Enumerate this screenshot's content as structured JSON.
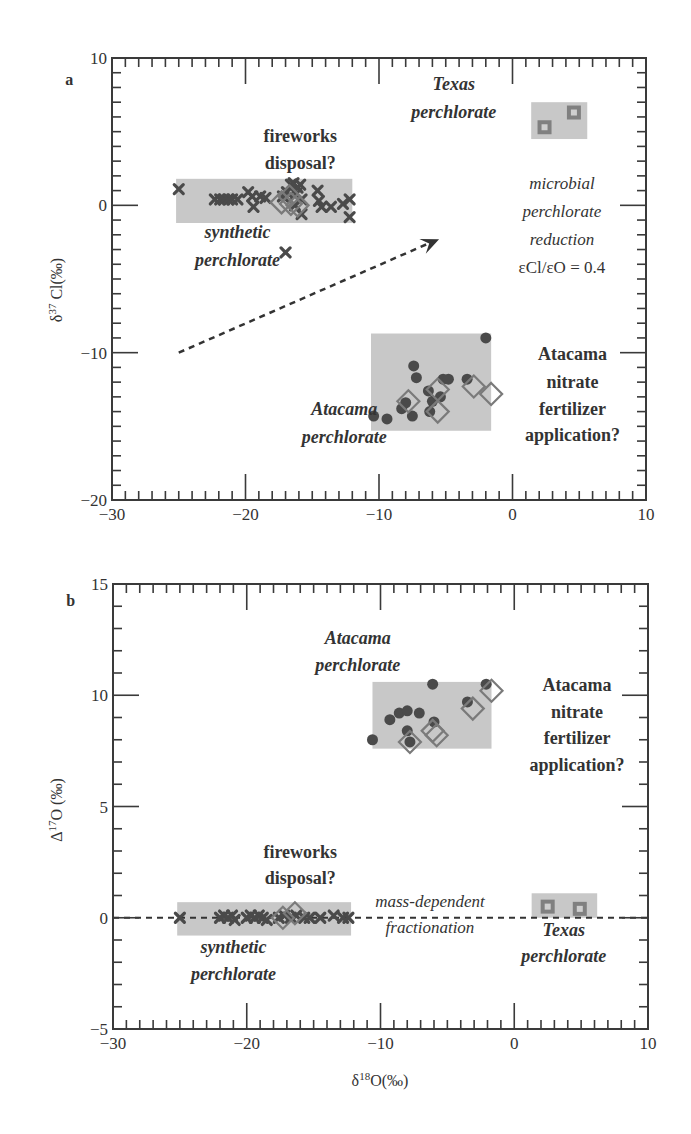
{
  "figure": {
    "colors": {
      "frame": "#3a3a3a",
      "region": "#c8c8c8",
      "marker_dark": "#4a4a4a",
      "marker_diamond": "#7a7a7a",
      "texas_square": "#808080",
      "texas_inner": "#cfcfcf",
      "text": "#333333"
    }
  },
  "chart_data": [
    {
      "panel": "a",
      "type": "scatter",
      "title": "",
      "xlabel": "δ18O(‰)",
      "ylabel": "δ37 Cl(‰)",
      "ylabel_base": "δ",
      "ylabel_sup": "37",
      "ylabel_rest": " Cl(‰)",
      "xlim": [
        -30,
        10
      ],
      "ylim": [
        -20,
        10
      ],
      "xticks": [
        -30,
        -20,
        -10,
        0,
        10
      ],
      "yticks": [
        10,
        0,
        -10,
        -20
      ],
      "grid": false,
      "regions": [
        {
          "name": "synthetic perchlorate",
          "x": [
            -25.2,
            -12
          ],
          "y": [
            -1.2,
            1.8
          ]
        },
        {
          "name": "Texas perchlorate",
          "x": [
            1.4,
            5.6
          ],
          "y": [
            4.5,
            7.0
          ]
        },
        {
          "name": "Atacama perchlorate",
          "x": [
            -10.6,
            -1.6
          ],
          "y": [
            -15.3,
            -8.7
          ]
        }
      ],
      "series": [
        {
          "name": "synthetic perchlorate",
          "marker": "x",
          "points": [
            [
              -25.0,
              1.1
            ],
            [
              -22.3,
              0.4
            ],
            [
              -21.9,
              0.4
            ],
            [
              -21.6,
              0.4
            ],
            [
              -21.3,
              0.4
            ],
            [
              -21.0,
              0.4
            ],
            [
              -20.6,
              0.4
            ],
            [
              -19.8,
              0.9
            ],
            [
              -19.5,
              0.6
            ],
            [
              -19.4,
              -0.1
            ],
            [
              -18.9,
              0.6
            ],
            [
              -18.5,
              0.5
            ],
            [
              -17.2,
              0.6
            ],
            [
              -16.9,
              0.9
            ],
            [
              -16.6,
              1.4
            ],
            [
              -16.4,
              1.5
            ],
            [
              -16.1,
              1.2
            ],
            [
              -15.9,
              1.4
            ],
            [
              -16.2,
              0.8
            ],
            [
              -15.8,
              0.4
            ],
            [
              -16.3,
              0.0
            ],
            [
              -15.8,
              -0.6
            ],
            [
              -14.6,
              1.0
            ],
            [
              -14.5,
              0.3
            ],
            [
              -14.3,
              -0.1
            ],
            [
              -13.6,
              -0.1
            ],
            [
              -12.7,
              0.1
            ],
            [
              -12.2,
              0.4
            ],
            [
              -12.2,
              -0.8
            ],
            [
              -17.0,
              -3.2
            ]
          ]
        },
        {
          "name": "fireworks disposal?",
          "marker": "diamond",
          "points": [
            [
              -17.3,
              0.2
            ],
            [
              -16.6,
              0.1
            ],
            [
              -16.1,
              0.0
            ],
            [
              -16.7,
              0.6
            ]
          ]
        },
        {
          "name": "Texas perchlorate",
          "marker": "square",
          "points": [
            [
              2.4,
              5.3
            ],
            [
              4.6,
              6.3
            ]
          ]
        },
        {
          "name": "Atacama perchlorate",
          "marker": "circle",
          "points": [
            [
              -10.4,
              -14.3
            ],
            [
              -9.4,
              -14.5
            ],
            [
              -8.3,
              -13.8
            ],
            [
              -8.0,
              -13.4
            ],
            [
              -7.2,
              -11.7
            ],
            [
              -6.3,
              -12.6
            ],
            [
              -6.2,
              -14.0
            ],
            [
              -6.0,
              -13.3
            ],
            [
              -5.4,
              -13.0
            ],
            [
              -5.2,
              -11.8
            ],
            [
              -4.8,
              -11.8
            ],
            [
              -2.0,
              -9.0
            ],
            [
              -3.4,
              -11.8
            ],
            [
              -7.5,
              -14.3
            ],
            [
              -7.4,
              -10.9
            ]
          ]
        },
        {
          "name": "Atacama nitrate fertilizer application?",
          "marker": "diamond",
          "points": [
            [
              -7.8,
              -13.3
            ],
            [
              -5.6,
              -12.5
            ],
            [
              -5.6,
              -14.0
            ],
            [
              -2.9,
              -12.3
            ],
            [
              -1.6,
              -12.8
            ]
          ]
        }
      ],
      "annotations": [
        {
          "id": "panel_letter",
          "text": "a",
          "style": "panel-letter",
          "x": -33.5,
          "y": 8.2
        },
        {
          "id": "fireworks1",
          "text": "fireworks",
          "style": "ann-bold",
          "x": -15.9,
          "y": 4.3
        },
        {
          "id": "fireworks2",
          "text": "disposal?",
          "style": "ann-bold",
          "x": -15.9,
          "y": 2.5
        },
        {
          "id": "synthetic1",
          "text": "synthetic",
          "style": "ann-bolditalic",
          "x": -20.6,
          "y": -2.2
        },
        {
          "id": "synthetic2",
          "text": "perchlorate",
          "style": "ann-bolditalic",
          "x": -20.6,
          "y": -4.1
        },
        {
          "id": "texas1",
          "text": "Texas",
          "style": "ann-bolditalic",
          "x": -4.4,
          "y": 7.8
        },
        {
          "id": "texas2",
          "text": "perchlorate",
          "style": "ann-bolditalic",
          "x": -4.4,
          "y": 5.9
        },
        {
          "id": "microbial1",
          "text": "microbial",
          "style": "ann-italic",
          "x": 3.7,
          "y": 1.1
        },
        {
          "id": "microbial2",
          "text": "perchlorate",
          "style": "ann-italic",
          "x": 3.7,
          "y": -0.8
        },
        {
          "id": "microbial3",
          "text": "reduction",
          "style": "ann-italic",
          "x": 3.7,
          "y": -2.7
        },
        {
          "id": "microbial4",
          "text": "εCl/εO = 0.4",
          "style": "ann-plain",
          "x": 3.7,
          "y": -4.6
        },
        {
          "id": "atacama1",
          "text": "Atacama",
          "style": "ann-bolditalic",
          "x": -12.6,
          "y": -14.2
        },
        {
          "id": "atacama2",
          "text": "perchlorate",
          "style": "ann-bolditalic",
          "x": -12.6,
          "y": -16.1
        },
        {
          "id": "nitrate1",
          "text": "Atacama",
          "style": "ann-bold",
          "x": 4.5,
          "y": -10.5
        },
        {
          "id": "nitrate2",
          "text": "nitrate",
          "style": "ann-bold",
          "x": 4.5,
          "y": -12.4
        },
        {
          "id": "nitrate3",
          "text": "fertilizer",
          "style": "ann-bold",
          "x": 4.5,
          "y": -14.2
        },
        {
          "id": "nitrate4",
          "text": "application?",
          "style": "ann-bold",
          "x": 4.5,
          "y": -16.0
        }
      ],
      "arrow": {
        "label": "microbial perchlorate reduction",
        "from": [
          -25.0,
          -10.0
        ],
        "to": [
          -5.5,
          -2.3
        ],
        "style": "dashed"
      }
    },
    {
      "panel": "b",
      "type": "scatter",
      "title": "",
      "xlabel": "δ18O(‰)",
      "xlabel_base": "δ",
      "xlabel_sup": "18",
      "xlabel_rest": "O(‰)",
      "ylabel": "Δ17O (‰)",
      "ylabel_base": "Δ",
      "ylabel_sup": "17",
      "ylabel_rest": "O (‰)",
      "xlim": [
        -30,
        10
      ],
      "ylim": [
        -5,
        15
      ],
      "xticks": [
        -30,
        -20,
        -10,
        0,
        10
      ],
      "yticks": [
        15,
        10,
        5,
        0,
        -5
      ],
      "grid": false,
      "regions": [
        {
          "name": "synthetic perchlorate",
          "x": [
            -25.2,
            -12.2
          ],
          "y": [
            -0.8,
            0.7
          ]
        },
        {
          "name": "Atacama perchlorate",
          "x": [
            -10.6,
            -1.7
          ],
          "y": [
            7.6,
            10.6
          ]
        },
        {
          "name": "Texas perchlorate",
          "x": [
            1.3,
            6.2
          ],
          "y": [
            0.0,
            1.1
          ]
        }
      ],
      "reference_line": {
        "name": "mass-dependent fractionation",
        "y": 0,
        "style": "dashed"
      },
      "series": [
        {
          "name": "synthetic perchlorate",
          "marker": "x",
          "points": [
            [
              -25.0,
              0.0
            ],
            [
              -22.0,
              0.0
            ],
            [
              -21.7,
              0.1
            ],
            [
              -21.4,
              0.0
            ],
            [
              -21.1,
              0.1
            ],
            [
              -20.9,
              -0.1
            ],
            [
              -20.0,
              0.0
            ],
            [
              -19.7,
              0.1
            ],
            [
              -19.4,
              0.0
            ],
            [
              -19.1,
              0.1
            ],
            [
              -18.8,
              0.0
            ],
            [
              -18.5,
              -0.1
            ],
            [
              -17.6,
              0.0
            ],
            [
              -17.2,
              0.1
            ],
            [
              -16.7,
              0.0
            ],
            [
              -16.3,
              0.1
            ],
            [
              -15.7,
              0.0
            ],
            [
              -15.3,
              0.0
            ],
            [
              -14.5,
              0.0
            ],
            [
              -13.5,
              0.1
            ],
            [
              -12.8,
              0.0
            ],
            [
              -12.4,
              0.0
            ]
          ]
        },
        {
          "name": "fireworks disposal?",
          "marker": "diamond",
          "points": [
            [
              -17.3,
              0.0
            ],
            [
              -16.4,
              0.2
            ]
          ]
        },
        {
          "name": "Atacama perchlorate",
          "marker": "circle",
          "points": [
            [
              -10.6,
              8.0
            ],
            [
              -9.3,
              8.9
            ],
            [
              -8.6,
              9.2
            ],
            [
              -8.0,
              9.3
            ],
            [
              -7.1,
              9.2
            ],
            [
              -6.1,
              10.5
            ],
            [
              -8.0,
              8.4
            ],
            [
              -7.8,
              7.9
            ],
            [
              -6.0,
              8.8
            ],
            [
              -3.5,
              9.7
            ],
            [
              -2.1,
              10.5
            ]
          ]
        },
        {
          "name": "Atacama nitrate fertilizer application?",
          "marker": "diamond",
          "points": [
            [
              -7.8,
              7.9
            ],
            [
              -5.8,
              8.2
            ],
            [
              -6.1,
              8.4
            ],
            [
              -3.1,
              9.4
            ],
            [
              -1.7,
              10.2
            ]
          ]
        },
        {
          "name": "Texas perchlorate",
          "marker": "square",
          "points": [
            [
              2.5,
              0.5
            ],
            [
              4.9,
              0.4
            ]
          ]
        }
      ],
      "annotations": [
        {
          "id": "panel_letter",
          "text": "b",
          "style": "panel-letter",
          "x": -33.5,
          "y": 14.0
        },
        {
          "id": "atacama1",
          "text": "Atacama",
          "style": "ann-bolditalic",
          "x": -11.7,
          "y": 12.3
        },
        {
          "id": "atacama2",
          "text": "perchlorate",
          "style": "ann-bolditalic",
          "x": -11.7,
          "y": 11.1
        },
        {
          "id": "nitrate1",
          "text": "Atacama",
          "style": "ann-bold",
          "x": 4.7,
          "y": 10.2
        },
        {
          "id": "nitrate2",
          "text": "nitrate",
          "style": "ann-bold",
          "x": 4.7,
          "y": 9.0
        },
        {
          "id": "nitrate3",
          "text": "fertilizer",
          "style": "ann-bold",
          "x": 4.7,
          "y": 7.8
        },
        {
          "id": "nitrate4",
          "text": "application?",
          "style": "ann-bold",
          "x": 4.7,
          "y": 6.6
        },
        {
          "id": "fireworks1",
          "text": "fireworks",
          "style": "ann-bold",
          "x": -16.0,
          "y": 2.7
        },
        {
          "id": "fireworks2",
          "text": "disposal?",
          "style": "ann-bold",
          "x": -16.0,
          "y": 1.5
        },
        {
          "id": "synthetic1",
          "text": "synthetic",
          "style": "ann-bolditalic",
          "x": -21.0,
          "y": -1.6
        },
        {
          "id": "synthetic2",
          "text": "perchlorate",
          "style": "ann-bolditalic",
          "x": -21.0,
          "y": -2.8
        },
        {
          "id": "mdf1",
          "text": "mass-dependent",
          "style": "ann-italic",
          "x": -6.3,
          "y": 0.5
        },
        {
          "id": "mdf2",
          "text": "fractionation",
          "style": "ann-italic",
          "x": -6.3,
          "y": -0.7
        },
        {
          "id": "texas1",
          "text": "Texas",
          "style": "ann-bolditalic",
          "x": 3.7,
          "y": -0.8
        },
        {
          "id": "texas2",
          "text": "perchlorate",
          "style": "ann-bolditalic",
          "x": 3.7,
          "y": -2.0
        }
      ]
    }
  ],
  "layout": {
    "panels": [
      {
        "left": 112,
        "top": 58,
        "right": 646,
        "bottom": 500
      },
      {
        "left": 113,
        "top": 584,
        "right": 648,
        "bottom": 1029
      }
    ]
  }
}
